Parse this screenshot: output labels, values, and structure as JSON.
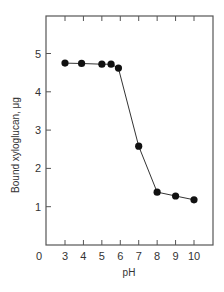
{
  "chart_data": {
    "type": "line",
    "title": "",
    "xlabel": "pH",
    "ylabel": "Bound xyloglucan, μg",
    "xlim": [
      1.0,
      11.0
    ],
    "ylim": [
      0,
      6.0
    ],
    "x_ticks": [
      3,
      4,
      5,
      6,
      7,
      8,
      9,
      10
    ],
    "y_ticks": [
      1,
      2,
      3,
      4,
      5
    ],
    "origin_label": "0",
    "grid": false,
    "legend": null,
    "series": [
      {
        "name": "Bound xyloglucan",
        "marker": "filled-circle",
        "x": [
          3,
          3.9,
          5,
          5.5,
          5.9,
          7,
          8,
          9,
          10
        ],
        "values": [
          4.75,
          4.74,
          4.72,
          4.72,
          4.62,
          2.58,
          1.38,
          1.28,
          1.18
        ]
      }
    ]
  },
  "colors": {
    "axis": "#555555",
    "line": "#333333",
    "marker": "#111111"
  }
}
